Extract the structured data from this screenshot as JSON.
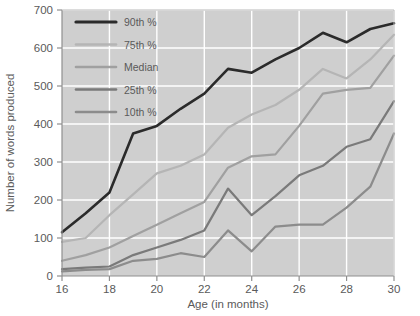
{
  "chart_data": {
    "type": "line",
    "title": "",
    "xlabel": "Age (in months)",
    "ylabel": "Number of words produced",
    "x": [
      16,
      17,
      18,
      19,
      20,
      21,
      22,
      23,
      24,
      25,
      26,
      27,
      28,
      29,
      30
    ],
    "xlim": [
      16,
      30
    ],
    "ylim": [
      0,
      700
    ],
    "xticks": [
      16,
      18,
      20,
      22,
      24,
      26,
      28,
      30
    ],
    "yticks": [
      0,
      100,
      200,
      300,
      400,
      500,
      600,
      700
    ],
    "xtick_labels": [
      "16",
      "18",
      "20",
      "22",
      "24",
      "26",
      "28",
      "30"
    ],
    "ytick_labels": [
      "0",
      "100",
      "200",
      "300",
      "400",
      "500",
      "600",
      "700"
    ],
    "grid": true,
    "grid_color": "#ffffff",
    "plot_background": "#cfcfcf",
    "legend_position": "upper-left",
    "series": [
      {
        "name": "90th %",
        "color": "#2b2b2b",
        "values": [
          115,
          165,
          220,
          375,
          395,
          440,
          480,
          545,
          535,
          570,
          600,
          640,
          615,
          650,
          665
        ]
      },
      {
        "name": "75th %",
        "color": "#b5b5b5",
        "values": [
          90,
          100,
          160,
          215,
          270,
          290,
          320,
          390,
          425,
          450,
          490,
          545,
          520,
          570,
          635
        ]
      },
      {
        "name": "Median",
        "color": "#a0a0a0",
        "values": [
          40,
          55,
          75,
          105,
          135,
          165,
          195,
          285,
          315,
          320,
          395,
          480,
          490,
          495,
          580
        ]
      },
      {
        "name": "25th %",
        "color": "#7a7a7a",
        "values": [
          18,
          22,
          25,
          55,
          75,
          95,
          120,
          230,
          160,
          210,
          265,
          290,
          340,
          360,
          460
        ]
      },
      {
        "name": "10th %",
        "color": "#8c8c8c",
        "values": [
          12,
          16,
          18,
          40,
          45,
          60,
          50,
          120,
          65,
          130,
          135,
          135,
          180,
          235,
          375
        ]
      }
    ]
  },
  "axis": {
    "x_title": "Age (in months)",
    "y_title": "Number of words produced"
  },
  "legend": {
    "items": [
      {
        "label": "90th %"
      },
      {
        "label": "75th %"
      },
      {
        "label": "Median"
      },
      {
        "label": "25th %"
      },
      {
        "label": "10th %"
      }
    ]
  }
}
